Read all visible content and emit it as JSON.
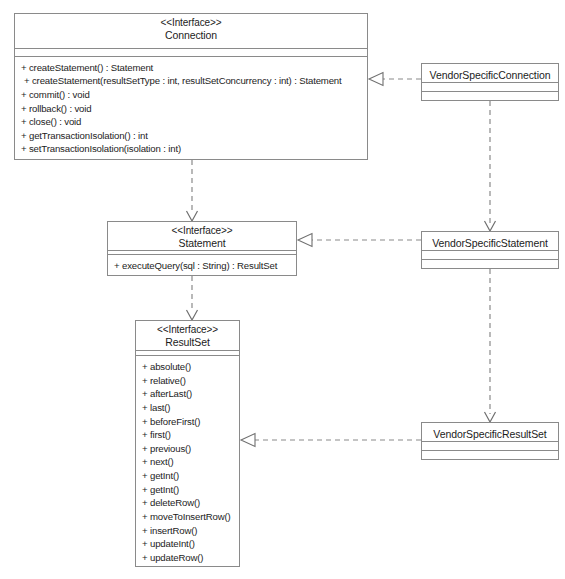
{
  "diagram": {
    "stereotype_label": "<<Interface>>",
    "line_color": "#8a8a8a",
    "text_color": "#1c1c1c",
    "background": "#ffffff"
  },
  "classes": {
    "connection": {
      "stereotype": "<<Interface>>",
      "name": "Connection",
      "operations": [
        "+ createStatement() : Statement",
        "+ createStatement(resultSetType : int, resultSetConcurrency : int) : Statement",
        "+ commit() : void",
        "+ rollback() : void",
        "+ close() : void",
        "+ getTransactionIsolation() : int",
        "+ setTransactionIsolation(isolation : int)"
      ]
    },
    "vendor_specific_connection": {
      "name": "VendorSpecificConnection",
      "operations": []
    },
    "statement": {
      "stereotype": "<<Interface>>",
      "name": "Statement",
      "operations": [
        "+ executeQuery(sql : String) : ResultSet"
      ]
    },
    "vendor_specific_statement": {
      "name": "VendorSpecificStatement",
      "operations": []
    },
    "result_set": {
      "stereotype": "<<Interface>>",
      "name": "ResultSet",
      "operations": [
        "+ absolute()",
        "+ relative()",
        "+ afterLast()",
        "+ last()",
        "+ beforeFirst()",
        "+ first()",
        "+ previous()",
        "+ next()",
        "+ getInt()",
        "+ getInt()",
        "+ deleteRow()",
        "+ moveToInsertRow()",
        "+ insertRow()",
        "+ updateInt()",
        "+ updateRow()",
        "+ refreshRow()"
      ]
    },
    "vendor_specific_result_set": {
      "name": "VendorSpecificResultSet",
      "operations": []
    }
  },
  "relationships": [
    {
      "id": "realize-connection",
      "type": "realization",
      "style": "dashed-hollow-triangle",
      "from": "VendorSpecificConnection",
      "to": "Connection"
    },
    {
      "id": "realize-statement",
      "type": "realization",
      "style": "dashed-hollow-triangle",
      "from": "VendorSpecificStatement",
      "to": "Statement"
    },
    {
      "id": "realize-resultset",
      "type": "realization",
      "style": "dashed-hollow-triangle",
      "from": "VendorSpecificResultSet",
      "to": "ResultSet"
    },
    {
      "id": "dep-connection-statement",
      "type": "dependency",
      "style": "dashed-open-arrow",
      "from": "Connection",
      "to": "Statement"
    },
    {
      "id": "dep-statement-resultset",
      "type": "dependency",
      "style": "dashed-open-arrow",
      "from": "Statement",
      "to": "ResultSet"
    },
    {
      "id": "dep-vsconnection-vsstatement",
      "type": "dependency",
      "style": "dashed-open-arrow",
      "from": "VendorSpecificConnection",
      "to": "VendorSpecificStatement"
    },
    {
      "id": "dep-vsstatement-vsresultset",
      "type": "dependency",
      "style": "dashed-open-arrow",
      "from": "VendorSpecificStatement",
      "to": "VendorSpecificResultSet"
    }
  ]
}
